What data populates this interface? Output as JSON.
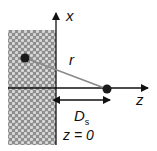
{
  "diagram": {
    "axis_x_label": "x",
    "axis_z_label": "z",
    "distance_label": "r",
    "ds_main": "D",
    "ds_sub": "s",
    "plane_label": "z = 0",
    "colors": {
      "substrate": "#9a9a9a",
      "axis": "#111111",
      "line_r": "#8a8a8a",
      "dot": "#1a1a1a"
    }
  }
}
